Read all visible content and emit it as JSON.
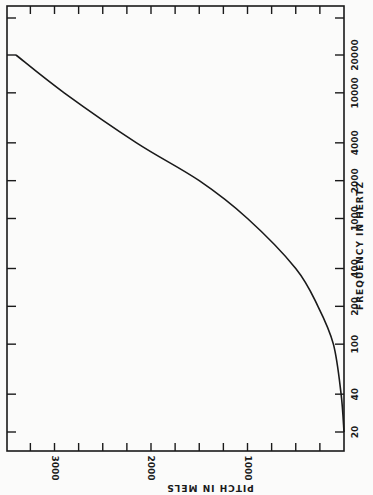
{
  "chart_data": {
    "type": "line",
    "title": "",
    "orientation": "rotated-90",
    "xlabel": "FREQUENCY IN HERTZ",
    "ylabel": "PITCH IN MELS",
    "x_scale": "log",
    "x_ticks": [
      20,
      40,
      100,
      200,
      400,
      1000,
      2000,
      4000,
      10000,
      20000
    ],
    "x_tick_labels": [
      "20",
      "40",
      "100",
      "200",
      "400",
      "1000",
      "2000",
      "4000",
      "10000",
      "20000"
    ],
    "y_ticks": [
      0,
      1000,
      2000,
      3000
    ],
    "y_tick_labels": [
      "1000",
      "2000",
      "3000"
    ],
    "y_minor_step": 250,
    "ylim": [
      0,
      3600
    ],
    "xlim": [
      15,
      26000
    ],
    "grid": false,
    "series": [
      {
        "name": "Mel scale",
        "x": [
          20,
          40,
          100,
          200,
          400,
          1000,
          2000,
          4000,
          10000,
          20000
        ],
        "values": [
          0,
          30,
          110,
          270,
          500,
          1000,
          1500,
          2150,
          2900,
          3400
        ]
      }
    ]
  },
  "labels": {
    "freq_axis_title": "FREQUENCY  IN  HERTZ",
    "pitch_axis_title": "PITCH  IN  MELS"
  },
  "colors": {
    "ink": "#1a1a1a",
    "paper": "#fbfbfa"
  }
}
